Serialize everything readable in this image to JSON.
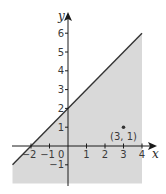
{
  "chart_data": {
    "type": "area",
    "title": "",
    "xlabel": "x",
    "ylabel": "y",
    "xlim": [
      -3,
      4
    ],
    "ylim": [
      -2,
      6
    ],
    "grid": false,
    "x_ticks": [
      -2,
      -1,
      1,
      2,
      3,
      4
    ],
    "x_tick_labels": [
      "−2",
      "−1",
      "1",
      "2",
      "3",
      "4"
    ],
    "y_ticks": [
      -1,
      1,
      2,
      3,
      4,
      5,
      6
    ],
    "y_tick_labels": [
      "−1",
      "1",
      "2",
      "3",
      "4",
      "5",
      "6"
    ],
    "origin_label": "0",
    "boundary_line": {
      "equation": "y = x + 2",
      "from": [
        -3,
        -1
      ],
      "to": [
        4,
        6
      ],
      "style": "solid"
    },
    "shaded_region": {
      "description": "y ≤ x + 2 (region below line)",
      "polygon": [
        [
          -3,
          -1
        ],
        [
          4,
          6
        ],
        [
          4,
          -2
        ],
        [
          -3,
          -2
        ]
      ],
      "color": "#d9d9d9"
    },
    "points": [
      {
        "x": 3,
        "y": 1,
        "label": "(3, 1)"
      }
    ]
  },
  "colors": {
    "shade": "#d9d9d9",
    "axis": "#1a1a1a",
    "line": "#333333",
    "text": "#3a3a3a"
  }
}
